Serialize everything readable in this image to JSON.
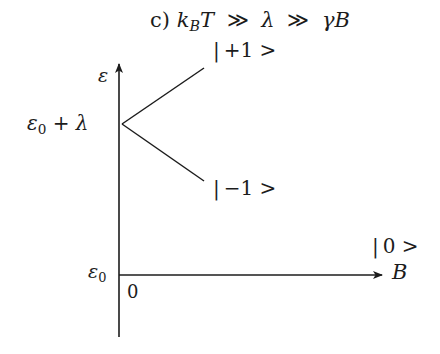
{
  "figure": {
    "title": {
      "panel": "c)",
      "k": "k",
      "k_sub": "B",
      "T": "T",
      "rel1": "≫",
      "lambda": "λ",
      "rel2": "≫",
      "gamma_b": "γB"
    },
    "axes": {
      "y_label": "ε",
      "x_label": "B",
      "origin_label": "0",
      "baseline": {
        "symbol": "ε",
        "sub": "0"
      }
    },
    "levels": {
      "split_point": {
        "symbol": "ε",
        "sub": "0",
        "rest": " + λ"
      },
      "states": {
        "plus": {
          "bar": "|",
          "text": "+1 >"
        },
        "minus": {
          "bar": "|",
          "text": "−1 >"
        },
        "zero": {
          "bar": "|",
          "text": "0 >"
        }
      }
    },
    "colors": {
      "ink": "#1c1c1c",
      "background": "#ffffff"
    }
  }
}
